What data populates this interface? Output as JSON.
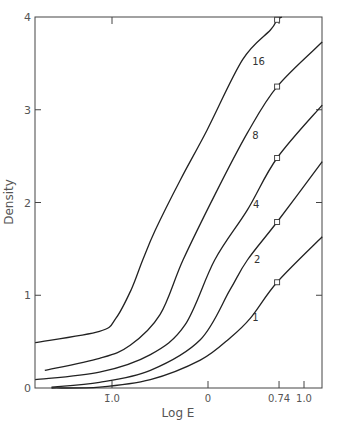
{
  "chart_data": {
    "type": "line",
    "title": "",
    "xlabel": "Log E",
    "ylabel": "Density",
    "xlim": [
      -1.8,
      1.19
    ],
    "ylim": [
      0,
      4
    ],
    "grid": false,
    "legend": "inline curve labels",
    "x_ticks": [
      {
        "value": -1.0,
        "label": "1̄.0"
      },
      {
        "value": 0,
        "label": "0"
      },
      {
        "value": 0.74,
        "label": "0.74"
      },
      {
        "value": 1.0,
        "label": "1.0"
      }
    ],
    "y_ticks": [
      {
        "value": 0,
        "label": "0"
      },
      {
        "value": 1,
        "label": "1"
      },
      {
        "value": 2,
        "label": "2"
      },
      {
        "value": 3,
        "label": "3"
      },
      {
        "value": 4,
        "label": "4"
      }
    ],
    "marker_x": 0.74,
    "series": [
      {
        "name": "16",
        "label_pos": [
          0.46,
          3.48
        ],
        "points": [
          [
            -1.8,
            0.49
          ],
          [
            -1.13,
            0.61
          ],
          [
            -0.96,
            0.75
          ],
          [
            -0.8,
            1.06
          ],
          [
            -0.68,
            1.38
          ],
          [
            -0.55,
            1.7
          ],
          [
            -0.29,
            2.24
          ],
          [
            -0.01,
            2.78
          ],
          [
            0.36,
            3.54
          ],
          [
            0.65,
            3.86
          ],
          [
            0.72,
            3.97
          ],
          [
            0.77,
            4.0
          ]
        ],
        "marker": [
          0.72,
          3.97
        ]
      },
      {
        "name": "8",
        "label_pos": [
          0.46,
          2.68
        ],
        "points": [
          [
            -1.7,
            0.19
          ],
          [
            -1.13,
            0.32
          ],
          [
            -0.81,
            0.46
          ],
          [
            -0.5,
            0.79
          ],
          [
            -0.26,
            1.38
          ],
          [
            0.07,
            2.08
          ],
          [
            0.41,
            2.75
          ],
          [
            0.72,
            3.25
          ],
          [
            1.19,
            3.73
          ]
        ],
        "marker": [
          0.72,
          3.25
        ]
      },
      {
        "name": "4",
        "label_pos": [
          0.47,
          1.94
        ],
        "points": [
          [
            -1.8,
            0.09
          ],
          [
            -1.13,
            0.17
          ],
          [
            -0.6,
            0.36
          ],
          [
            -0.24,
            0.68
          ],
          [
            0.07,
            1.38
          ],
          [
            0.41,
            1.92
          ],
          [
            0.72,
            2.48
          ],
          [
            1.19,
            3.05
          ]
        ],
        "marker": [
          0.72,
          2.48
        ]
      },
      {
        "name": "2",
        "label_pos": [
          0.48,
          1.35
        ],
        "points": [
          [
            -1.63,
            0.01
          ],
          [
            -1.13,
            0.06
          ],
          [
            -0.6,
            0.19
          ],
          [
            -0.08,
            0.52
          ],
          [
            0.23,
            1.06
          ],
          [
            0.41,
            1.38
          ],
          [
            0.72,
            1.79
          ],
          [
            1.19,
            2.44
          ]
        ],
        "marker": [
          0.72,
          1.79
        ]
      },
      {
        "name": "1",
        "label_pos": [
          0.46,
          0.72
        ],
        "points": [
          [
            -1.63,
            0.0
          ],
          [
            -1.13,
            0.01
          ],
          [
            -0.6,
            0.09
          ],
          [
            -0.08,
            0.3
          ],
          [
            0.23,
            0.54
          ],
          [
            0.44,
            0.75
          ],
          [
            0.72,
            1.14
          ],
          [
            1.19,
            1.63
          ]
        ],
        "marker": [
          0.72,
          1.14
        ]
      }
    ]
  }
}
